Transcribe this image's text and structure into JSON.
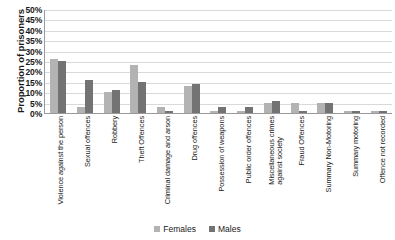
{
  "chart_data": {
    "type": "bar",
    "title": "",
    "xlabel": "",
    "ylabel": "Proportion of prisoners",
    "ylim": [
      0,
      50
    ],
    "ytick_labels": [
      "50%",
      "45%",
      "40%",
      "35%",
      "30%",
      "25%",
      "20%",
      "15%",
      "10%",
      "5%",
      "0%"
    ],
    "ytick_values": [
      50,
      45,
      40,
      35,
      30,
      25,
      20,
      15,
      10,
      5,
      0
    ],
    "grid": true,
    "legend_position": "bottom",
    "categories": [
      "Violence against the person",
      "Sexual offences",
      "Robbery",
      "Theft Offences",
      "Criminal damage and arson",
      "Drug offences",
      "Possession of weapons",
      "Public order offences",
      "Miscellaneous crimes against society",
      "Fraud Offences",
      "Summary Non-Motoring",
      "Summary motoring",
      "Offence not recorded"
    ],
    "category_lines": [
      [
        "Violence against the person"
      ],
      [
        "Sexual offences"
      ],
      [
        "Robbery"
      ],
      [
        "Theft Offences"
      ],
      [
        "Criminal damage and arson"
      ],
      [
        "Drug offences"
      ],
      [
        "Possession of weapons"
      ],
      [
        "Public order offences"
      ],
      [
        "Miscellaneous crimes",
        "against society"
      ],
      [
        "Fraud Offences"
      ],
      [
        "Summary Non-Motoring"
      ],
      [
        "Summary motoring"
      ],
      [
        "Offence not recorded"
      ]
    ],
    "series": [
      {
        "name": "Females",
        "color": "#b3b3b3",
        "values": [
          26,
          3,
          10,
          23,
          3,
          13,
          1,
          1,
          5,
          5,
          5,
          1,
          1
        ]
      },
      {
        "name": "Males",
        "color": "#737373",
        "values": [
          25,
          16,
          11,
          15,
          1,
          14,
          3,
          3,
          6,
          1,
          5,
          1,
          1
        ]
      }
    ]
  },
  "legend": {
    "items": [
      {
        "label": "Females",
        "key": "f"
      },
      {
        "label": "Males",
        "key": "m"
      }
    ]
  }
}
